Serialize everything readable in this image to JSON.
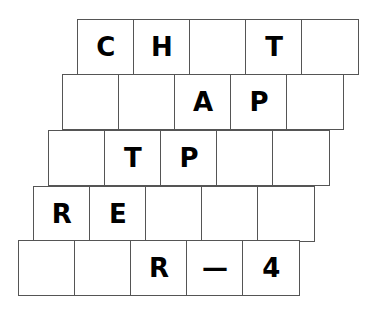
{
  "puzzle": {
    "rows": [
      {
        "x": 77,
        "y": 19,
        "cells": [
          "C",
          "H",
          "",
          "T",
          ""
        ]
      },
      {
        "x": 62,
        "y": 74,
        "cells": [
          "",
          "",
          "A",
          "P",
          ""
        ]
      },
      {
        "x": 48,
        "y": 130,
        "cells": [
          "",
          "T",
          "P",
          "",
          ""
        ]
      },
      {
        "x": 33,
        "y": 186,
        "cells": [
          "R",
          "E",
          "",
          "",
          ""
        ]
      },
      {
        "x": 18,
        "y": 240,
        "cells": [
          "",
          "",
          "R",
          "—",
          "4"
        ]
      }
    ]
  }
}
